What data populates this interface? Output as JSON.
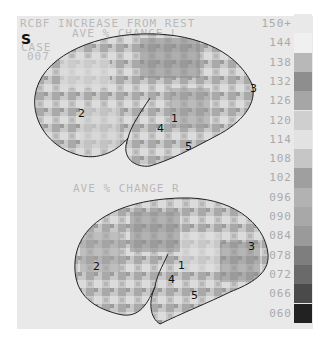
{
  "figure": {
    "panel_letter": "S",
    "title": "RCBF INCREASE FROM REST",
    "case_label": "CASE",
    "case_number": "007",
    "top_map": {
      "subtitle": "AVE % CHANGE L",
      "region_labels": [
        "1",
        "2",
        "3",
        "4",
        "5"
      ]
    },
    "bottom_map": {
      "subtitle": "AVE % CHANGE R",
      "region_labels": [
        "1",
        "2",
        "3",
        "4",
        "5"
      ]
    },
    "color_scale": {
      "unit_marker": "150+",
      "ticks": [
        "150+",
        "144",
        "138",
        "132",
        "126",
        "120",
        "114",
        "108",
        "102",
        "096",
        "090",
        "084",
        "078",
        "072",
        "066",
        "060"
      ],
      "swatch_colors": [
        "#e9e9e9",
        "#f0f0f0",
        "#b8b8b8",
        "#8e8e8e",
        "#a6a6a6",
        "#cfcfcf",
        "#e2e2e2",
        "#c6c6c6",
        "#9f9f9f",
        "#b2b2b2",
        "#a8a8a8",
        "#9a9a9a",
        "#7e7e7e",
        "#6a6a6a",
        "#4a4a4a",
        "#222222"
      ]
    }
  }
}
